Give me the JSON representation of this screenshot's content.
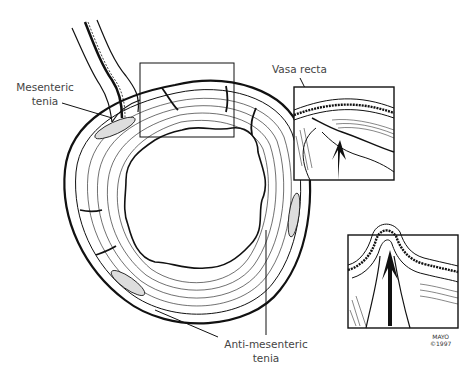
{
  "figure": {
    "labels": {
      "mesenteric_line1": "Mesenteric",
      "mesenteric_line2": "tenia",
      "vasa_recta": "Vasa recta",
      "anti_mesenteric_line1": "Anti-mesenteric",
      "anti_mesenteric_line2": "tenia"
    },
    "credit": {
      "line1": "MAYO",
      "line2": "©1997"
    },
    "colors": {
      "ink": "#111111",
      "label_text": "#444444",
      "background": "#ffffff"
    }
  }
}
